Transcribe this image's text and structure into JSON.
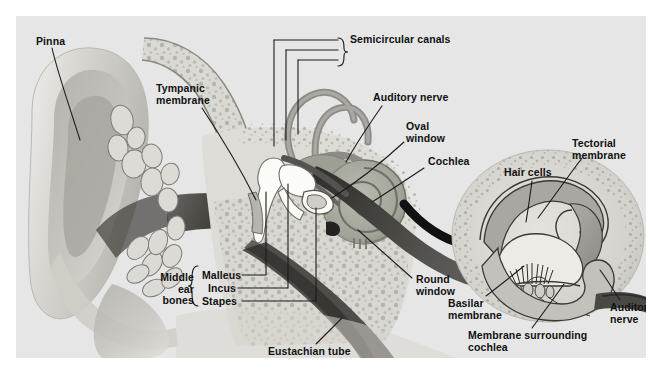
{
  "figure": {
    "type": "anatomical-diagram",
    "background_color": "#e6e6e6",
    "page_background": "#ffffff"
  },
  "colors": {
    "panel_bg": "#e6e6e6",
    "skin_light": "#dcdcd8",
    "skin_mid": "#c9c7c2",
    "skin_dark": "#9b9a95",
    "bone_fill": "#d7d5cf",
    "bone_stroke": "#7d7b76",
    "canal_dark": "#4e4c4a",
    "canal_darkest": "#2b2a29",
    "cochlea_fill": "#a9aaa0",
    "cochlea_dark": "#7e7f75",
    "ossicle_white": "#fbfbf8",
    "nerve_dark": "#3f3e3c",
    "arrow_black": "#111111",
    "label_text": "#111111",
    "leader_line": "#222222",
    "inset_bg": "#dddbd6",
    "inset_fluid": "#bdbbb5"
  },
  "labels": {
    "pinna": "Pinna",
    "tympanic_membrane": "Tympanic\nmembrane",
    "semicircular_canals": "Semicircular canals",
    "auditory_nerve": "Auditory nerve",
    "oval_window": "Oval\nwindow",
    "cochlea": "Cochlea",
    "middle_ear_bones": "Middle\near\nbones",
    "malleus": "Malleus",
    "incus": "Incus",
    "stapes": "Stapes",
    "round_window": "Round\nwindow",
    "eustachian_tube": "Eustachian tube",
    "tectorial_membrane": "Tectorial\nmembrane",
    "hair_cells": "Hair cells",
    "basilar_membrane": "Basilar\nmembrane",
    "membrane_surrounding_cochlea": "Membrane surrounding\ncochlea",
    "inset_auditory_nerve": "Auditory\nnerve"
  },
  "label_positions": {
    "pinna": {
      "x": 20,
      "y": 20
    },
    "tympanic_membrane": {
      "x": 140,
      "y": 67
    },
    "semicircular_canals": {
      "x": 327,
      "y": 18
    },
    "auditory_nerve": {
      "x": 357,
      "y": 76
    },
    "oval_window": {
      "x": 390,
      "y": 105
    },
    "cochlea": {
      "x": 412,
      "y": 140
    },
    "middle_ear_bones": {
      "x": 142,
      "y": 256
    },
    "malleus": {
      "x": 186,
      "y": 256
    },
    "incus": {
      "x": 186,
      "y": 269
    },
    "stapes": {
      "x": 186,
      "y": 282
    },
    "round_window": {
      "x": 400,
      "y": 258
    },
    "eustachian_tube": {
      "x": 252,
      "y": 330
    },
    "tectorial_membrane": {
      "x": 565,
      "y": 122
    },
    "hair_cells": {
      "x": 500,
      "y": 151
    },
    "basilar_membrane": {
      "x": 445,
      "y": 284
    },
    "membrane_surrounding_cochlea": {
      "x": 470,
      "y": 316
    },
    "inset_auditory_nerve": {
      "x": 608,
      "y": 288
    }
  }
}
